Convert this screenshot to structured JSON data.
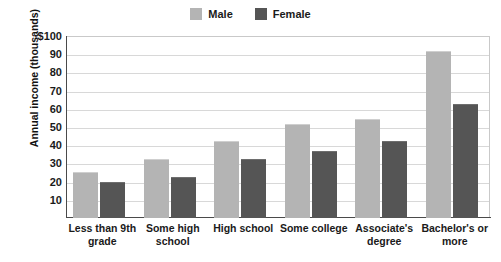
{
  "chart_data": {
    "type": "bar",
    "title": "",
    "subtitle": "",
    "xlabel": "",
    "ylabel": "Annual income (thousands)",
    "ylim": [
      0,
      100
    ],
    "yticks": [
      10,
      20,
      30,
      40,
      50,
      60,
      70,
      80,
      90,
      100
    ],
    "ytick_labels": [
      "10",
      "20",
      "30",
      "40",
      "50",
      "60",
      "70",
      "80",
      "90",
      "$100"
    ],
    "grid": "horizontal",
    "legend_position": "top-center",
    "categories": [
      "Less than 9th grade",
      "Some high school",
      "High school",
      "Some college",
      "Associate's degree",
      "Bachelor's or more"
    ],
    "series": [
      {
        "name": "Male",
        "color": "#b4b4b4",
        "values": [
          25,
          32,
          42,
          51,
          54,
          91
        ]
      },
      {
        "name": "Female",
        "color": "#555555",
        "values": [
          19,
          22,
          32,
          36,
          42,
          62
        ]
      }
    ]
  },
  "legend": {
    "items": [
      {
        "label": "Male",
        "color": "#b4b4b4"
      },
      {
        "label": "Female",
        "color": "#555555"
      }
    ]
  },
  "axes": {
    "y_title": "Annual income (thousands)"
  }
}
